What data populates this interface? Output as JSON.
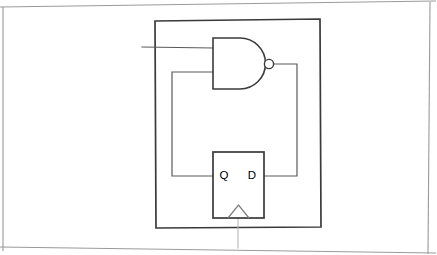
{
  "image": {
    "kind": "scanned-hand-drawn-schematic",
    "width": 437,
    "height": 255,
    "background_color": "#ffffff",
    "ink_color": "#3b3b3b",
    "paper_edge_color": "#9a9a9a"
  },
  "diagram": {
    "title": "",
    "boundary": {
      "name": "module boundary",
      "x": 155,
      "y": 20,
      "width": 165,
      "height": 208
    },
    "components": [
      {
        "id": "nand-gate",
        "type": "nand",
        "label": "",
        "inputs": 2,
        "inverting_output": true,
        "x": 213,
        "y": 38,
        "width": 54,
        "height": 51
      },
      {
        "id": "flip-flop",
        "type": "d-flip-flop",
        "label": "",
        "x": 213,
        "y": 152,
        "width": 51,
        "height": 66,
        "pins": [
          {
            "id": "q-pin",
            "label": "Q",
            "side": "left"
          },
          {
            "id": "d-pin",
            "label": "D",
            "side": "right"
          }
        ],
        "clock": {
          "id": "clock-input",
          "label": "",
          "side": "bottom",
          "edge_triggered": true
        }
      }
    ],
    "nets": [
      {
        "id": "primary-input-net",
        "label": "",
        "from": "external-left",
        "to": "nand-input-1"
      },
      {
        "id": "feedback-net",
        "label": "",
        "from": "flip-flop-q",
        "to": "nand-input-2"
      },
      {
        "id": "nand-output-net",
        "label": "",
        "from": "nand-output",
        "to": "flip-flop-d"
      },
      {
        "id": "clock-net",
        "label": "",
        "from": "flip-flop-clock",
        "to": "external-bottom"
      }
    ]
  },
  "labels": {
    "q": "Q",
    "d": "D"
  }
}
